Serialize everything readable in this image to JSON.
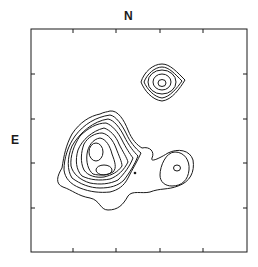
{
  "figure": {
    "type": "contour-map",
    "orientation_labels": {
      "north": "N",
      "east": "E"
    },
    "frame": {
      "ticks_per_side": 4
    },
    "colors": {
      "line": "#1a1a1a",
      "background": "#ffffff"
    },
    "sources": [
      {
        "name": "compact-source-upper-right",
        "contour_count": 5,
        "center_px": [
          162,
          83
        ]
      },
      {
        "name": "extended-source-main",
        "contour_count": 9,
        "peaks": 2,
        "center_px": [
          97,
          157
        ]
      },
      {
        "name": "secondary-source-right",
        "contour_count": 3,
        "center_px": [
          177,
          168
        ]
      }
    ],
    "marker": {
      "name": "small-dot",
      "position_px": [
        135,
        173
      ]
    }
  }
}
